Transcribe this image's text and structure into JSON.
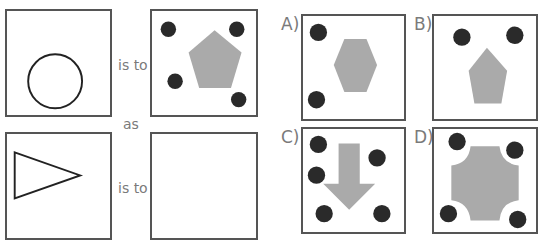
{
  "puzzle": {
    "relation_labels": {
      "is_to_1": "is to",
      "as": "as",
      "is_to_2": "is to"
    },
    "options": [
      {
        "letter": "A)",
        "description": "hexagon with two dots"
      },
      {
        "letter": "B)",
        "description": "pentagon with two dots"
      },
      {
        "letter": "C)",
        "description": "down arrow with five dots"
      },
      {
        "letter": "D)",
        "description": "concave octagon with four dots"
      }
    ],
    "colors": {
      "border": "#555555",
      "dot": "#2a2a2a",
      "shape_fill": "#aaaaaa",
      "outline": "#222222",
      "label": "#7a7a7a"
    }
  }
}
